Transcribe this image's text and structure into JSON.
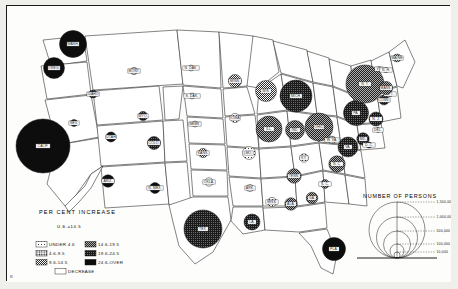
{
  "figure": {
    "type": "thematic-map",
    "region": "United States",
    "corner_mark": "III"
  },
  "legend_percent": {
    "title": "PER CENT INCREASE",
    "subtitle": "U.S.=14.5",
    "items": [
      {
        "label": "UNDER 4.6",
        "pattern": "dots-sparse"
      },
      {
        "label": "4.6-9.5",
        "pattern": "dots-medium"
      },
      {
        "label": "9.6-14.5",
        "pattern": "hatch-light"
      },
      {
        "label": "14.6-19.5",
        "pattern": "hatch-medium"
      },
      {
        "label": "19.6-24.5",
        "pattern": "hatch-dark"
      },
      {
        "label": "24.6-OVER",
        "pattern": "solid-black"
      },
      {
        "label": "DECREASE",
        "pattern": "white"
      }
    ]
  },
  "legend_persons": {
    "title": "NUMBER OF PERSONS",
    "values": [
      "1,500,000",
      "1,000,000",
      "500,000",
      "100,000",
      "10,000"
    ]
  },
  "chart_data": {
    "type": "map",
    "title": "PER CENT INCREASE",
    "subtitle": "U.S.=14.5",
    "value_legend_title": "NUMBER OF PERSONS",
    "size_breaks": [
      1500000,
      1000000,
      500000,
      100000,
      10000
    ],
    "class_breaks": [
      "UNDER 4.6",
      "4.6-9.5",
      "9.6-14.5",
      "14.6-19.5",
      "19.6-24.5",
      "24.6-OVER",
      "DECREASE"
    ],
    "points": [
      {
        "state": "WASH.",
        "x": 66,
        "y": 38,
        "r": 13.5,
        "cls": "solid-black"
      },
      {
        "state": "OREG.",
        "x": 47,
        "y": 62,
        "r": 10.5,
        "cls": "solid-black"
      },
      {
        "state": "CALIF.",
        "x": 36,
        "y": 140,
        "r": 27,
        "cls": "solid-black"
      },
      {
        "state": "IDAHO",
        "x": 86,
        "y": 88,
        "r": 4.0,
        "cls": "hatch-dark"
      },
      {
        "state": "MONT.",
        "x": 127,
        "y": 65,
        "r": 3.6,
        "cls": "dots-medium"
      },
      {
        "state": "WYO.",
        "x": 136,
        "y": 110,
        "r": 4.6,
        "cls": "hatch-dark"
      },
      {
        "state": "NEV.",
        "x": 67,
        "y": 117,
        "r": 3.4,
        "cls": "solid-black"
      },
      {
        "state": "UTAH",
        "x": 104,
        "y": 131,
        "r": 5.0,
        "cls": "solid-black"
      },
      {
        "state": "COLO.",
        "x": 147,
        "y": 137,
        "r": 6.5,
        "cls": "hatch-dark"
      },
      {
        "state": "ARIZ.",
        "x": 101,
        "y": 175,
        "r": 6.2,
        "cls": "solid-black"
      },
      {
        "state": "N. MEX.",
        "x": 148,
        "y": 182,
        "r": 5.4,
        "cls": "solid-black"
      },
      {
        "state": "N. DAK.",
        "x": 184,
        "y": 62,
        "r": 3.0,
        "cls": "white"
      },
      {
        "state": "S. DAK.",
        "x": 185,
        "y": 90,
        "r": 3.0,
        "cls": "white"
      },
      {
        "state": "NEBR.",
        "x": 188,
        "y": 118,
        "r": 3.0,
        "cls": "white"
      },
      {
        "state": "KANS.",
        "x": 196,
        "y": 147,
        "r": 4.6,
        "cls": "hatch-light"
      },
      {
        "state": "OKLA.",
        "x": 202,
        "y": 176,
        "r": 4.2,
        "cls": "white"
      },
      {
        "state": "TEX.",
        "x": 196,
        "y": 223,
        "r": 19,
        "cls": "hatch-dark"
      },
      {
        "state": "MINN.",
        "x": 228,
        "y": 75,
        "r": 6.5,
        "cls": "hatch-light"
      },
      {
        "state": "IOWA",
        "x": 228,
        "y": 112,
        "r": 4.6,
        "cls": "dots-sparse"
      },
      {
        "state": "MO.",
        "x": 242,
        "y": 147,
        "r": 6.4,
        "cls": "dots-sparse"
      },
      {
        "state": "ARK.",
        "x": 243,
        "y": 182,
        "r": 3.6,
        "cls": "white"
      },
      {
        "state": "LA.",
        "x": 245,
        "y": 216,
        "r": 8.0,
        "cls": "hatch-dark"
      },
      {
        "state": "WIS.",
        "x": 259,
        "y": 85,
        "r": 10.5,
        "cls": "hatch-light"
      },
      {
        "state": "ILL.",
        "x": 262,
        "y": 123,
        "r": 13,
        "cls": "hatch-medium"
      },
      {
        "state": "MICH.",
        "x": 289,
        "y": 90,
        "r": 16,
        "cls": "hatch-dark"
      },
      {
        "state": "IND.",
        "x": 288,
        "y": 124,
        "r": 9.5,
        "cls": "hatch-medium"
      },
      {
        "state": "OHIO",
        "x": 312,
        "y": 121,
        "r": 14,
        "cls": "hatch-medium"
      },
      {
        "state": "KY.",
        "x": 297,
        "y": 152,
        "r": 4.2,
        "cls": "dots-sparse"
      },
      {
        "state": "TENN.",
        "x": 287,
        "y": 170,
        "r": 7.2,
        "cls": "hatch-medium"
      },
      {
        "state": "MISS.",
        "x": 265,
        "y": 196,
        "r": 4.6,
        "cls": "dots-sparse"
      },
      {
        "state": "ALA.",
        "x": 284,
        "y": 198,
        "r": 6.2,
        "cls": "hatch-medium"
      },
      {
        "state": "GA.",
        "x": 305,
        "y": 192,
        "r": 5.8,
        "cls": "hatch-medium"
      },
      {
        "state": "FLA.",
        "x": 327,
        "y": 243,
        "r": 11.5,
        "cls": "solid-black"
      },
      {
        "state": "S. C.",
        "x": 318,
        "y": 178,
        "r": 4.4,
        "cls": "hatch-medium"
      },
      {
        "state": "N. C.",
        "x": 330,
        "y": 158,
        "r": 8.2,
        "cls": "hatch-medium"
      },
      {
        "state": "VA.",
        "x": 341,
        "y": 141,
        "r": 10.0,
        "cls": "hatch-dark"
      },
      {
        "state": "W. VA.",
        "x": 325,
        "y": 134,
        "r": 3.8,
        "cls": "dots-medium"
      },
      {
        "state": "MD.",
        "x": 356,
        "y": 133,
        "r": 6.2,
        "cls": "hatch-dark"
      },
      {
        "state": "D. C.",
        "x": 362,
        "y": 139,
        "r": 3.0,
        "cls": "hatch-dark"
      },
      {
        "state": "PA.",
        "x": 349,
        "y": 107,
        "r": 12.5,
        "cls": "hatch-dark"
      },
      {
        "state": "N. Y.",
        "x": 358,
        "y": 78,
        "r": 19,
        "cls": "hatch-medium"
      },
      {
        "state": "N. J.",
        "x": 369,
        "y": 113,
        "r": 7.0,
        "cls": "hatch-dark"
      },
      {
        "state": "DEL.",
        "x": 371,
        "y": 124,
        "r": 2.4,
        "cls": "hatch-dark"
      },
      {
        "state": "CONN.",
        "x": 377,
        "y": 94,
        "r": 5.0,
        "cls": "hatch-dark"
      },
      {
        "state": "R. I.",
        "x": 383,
        "y": 88,
        "r": 2.6,
        "cls": "hatch-medium"
      },
      {
        "state": "MASS.",
        "x": 379,
        "y": 82,
        "r": 6.6,
        "cls": "hatch-medium"
      },
      {
        "state": "VT.",
        "x": 372,
        "y": 63,
        "r": 2.4,
        "cls": "dots-medium"
      },
      {
        "state": "N. H.",
        "x": 379,
        "y": 64,
        "r": 2.6,
        "cls": "dots-medium"
      },
      {
        "state": "MAINE",
        "x": 390,
        "y": 52,
        "r": 4.0,
        "cls": "hatch-light"
      }
    ]
  }
}
